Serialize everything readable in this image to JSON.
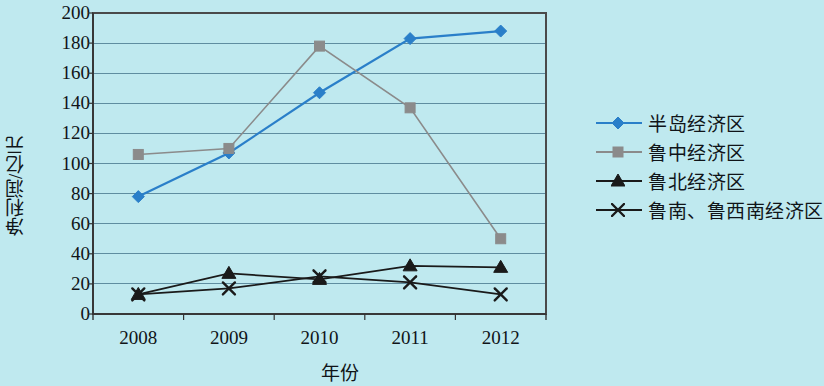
{
  "chart_data": {
    "type": "line",
    "title": "",
    "xlabel": "年份",
    "ylabel": "净利润/亿元",
    "categories": [
      "2008",
      "2009",
      "2010",
      "2011",
      "2012"
    ],
    "ylim": [
      0,
      200
    ],
    "ytick_step": 20,
    "yticks": [
      "200",
      "180",
      "160",
      "140",
      "120",
      "100",
      "80",
      "60",
      "40",
      "20",
      "0"
    ],
    "grid": "horizontal",
    "legend_position": "right",
    "series": [
      {
        "name": "半岛经济区",
        "marker": "diamond",
        "color": "#2a7fc9",
        "values": [
          78,
          107,
          147,
          183,
          188
        ]
      },
      {
        "name": "鲁中经济区",
        "marker": "square",
        "color": "#8b8b8b",
        "values": [
          106,
          110,
          178,
          137,
          50
        ]
      },
      {
        "name": "鲁北经济区",
        "marker": "triangle",
        "color": "#1a1a1a",
        "values": [
          13,
          27,
          23,
          32,
          31
        ]
      },
      {
        "name": "鲁南、鲁西南经济区",
        "marker": "cross",
        "color": "#1a1a1a",
        "values": [
          13,
          17,
          25,
          21,
          13
        ]
      }
    ]
  },
  "colors": {
    "background": "#bfe9ef",
    "gridline": "#5f8da0",
    "axis": "#333333",
    "text": "#101418"
  }
}
